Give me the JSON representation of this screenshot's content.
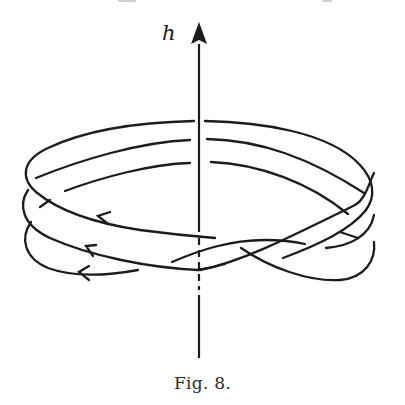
{
  "figure": {
    "axis_label": "h",
    "caption": "Fig. 8.",
    "axis": {
      "direction": "up",
      "style_above_band": "solid",
      "style_through_band": "dashed",
      "style_below_band": "solid"
    },
    "strands": [
      {
        "name": "top-strand",
        "arrow": "left"
      },
      {
        "name": "middle-strand",
        "arrow": "left"
      },
      {
        "name": "bottom-strand",
        "arrow": "left"
      }
    ],
    "colors": {
      "ink": "#1c1c1c",
      "background": "#ffffff"
    }
  }
}
